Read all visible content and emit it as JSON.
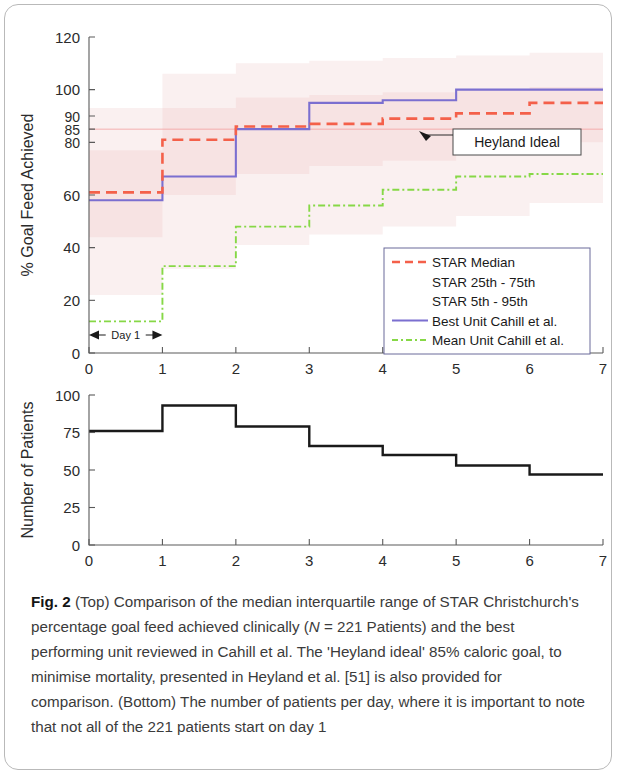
{
  "figure": {
    "label": "Fig. 2",
    "caption": "(Top) Comparison of the median interquartile range of STAR Christchurch's percentage goal feed achieved clinically (N = 221 Patients) and the best performing unit reviewed in Cahill et al. The 'Heyland ideal' 85% caloric goal, to minimise mortality, presented in Heyland et al. [51] is also provided for comparison. (Bottom) The number of patients per day, where it is important to note that not all of the 221 patients start on day 1"
  },
  "colors": {
    "star_median": "#f4604a",
    "star_iqr_band": "#f7e3e3",
    "star_5_95_band": "#faf0f0",
    "best_unit": "#7b6fd0",
    "mean_unit": "#86d846",
    "patients_line": "#1a1a1a",
    "axis": "#5a5a5a",
    "heyland_line": "#f4a0a0"
  },
  "annotations": {
    "heyland": {
      "text": "Heyland Ideal",
      "target_y": 85
    },
    "day1": {
      "text": "Day 1",
      "from_x": 0,
      "to_x": 1
    }
  },
  "legend": {
    "items": [
      {
        "label": "STAR Median",
        "style": "dashed",
        "color": "#f4604a",
        "show_sample": true
      },
      {
        "label": "STAR 25th - 75th",
        "style": "band",
        "color": "#f7e3e3",
        "show_sample": false
      },
      {
        "label": "STAR 5th - 95th",
        "style": "band",
        "color": "#faf0f0",
        "show_sample": false
      },
      {
        "label": "Best Unit Cahill et al.",
        "style": "solid",
        "color": "#7b6fd0",
        "show_sample": true
      },
      {
        "label": "Mean Unit Cahill et al.",
        "style": "dashdot",
        "color": "#86d846",
        "show_sample": true
      }
    ]
  },
  "chart_data": [
    {
      "type": "line",
      "id": "goal-feed-achieved",
      "title": "",
      "xlabel": "",
      "ylabel": "% Goal Feed Achieved",
      "xlim": [
        0,
        7
      ],
      "ylim": [
        0,
        120
      ],
      "xticks": [
        0,
        1,
        2,
        3,
        4,
        5,
        6,
        7
      ],
      "yticks": [
        0,
        20,
        40,
        60,
        80,
        85,
        90,
        100,
        120
      ],
      "grid": false,
      "legend_position": "lower-right",
      "step_style": "post",
      "x": [
        0,
        1,
        2,
        3,
        4,
        5,
        6,
        7
      ],
      "series": [
        {
          "name": "STAR Median",
          "values": [
            61,
            81,
            86,
            87,
            89,
            91,
            95,
            95
          ]
        },
        {
          "name": "STAR 25th",
          "values": [
            44,
            60,
            68,
            71,
            73,
            76,
            80,
            80
          ]
        },
        {
          "name": "STAR 75th",
          "values": [
            77,
            93,
            97,
            98,
            99,
            100,
            101,
            101
          ]
        },
        {
          "name": "STAR 5th",
          "values": [
            22,
            32,
            41,
            45,
            48,
            52,
            57,
            57
          ]
        },
        {
          "name": "STAR 95th",
          "values": [
            93,
            106,
            110,
            111,
            112,
            113,
            114,
            114
          ]
        },
        {
          "name": "Best Unit Cahill et al.",
          "values": [
            58,
            67,
            85,
            95,
            96,
            100,
            100,
            100
          ]
        },
        {
          "name": "Mean Unit Cahill et al.",
          "values": [
            12,
            33,
            48,
            56,
            62,
            67,
            68,
            68
          ]
        }
      ],
      "reference_lines": [
        {
          "name": "Heyland Ideal",
          "y": 85
        }
      ]
    },
    {
      "type": "line",
      "id": "number-of-patients",
      "title": "",
      "xlabel": "Days in ICU",
      "ylabel": "Number of Patients",
      "xlim": [
        0,
        7
      ],
      "ylim": [
        0,
        100
      ],
      "xticks": [
        0,
        1,
        2,
        3,
        4,
        5,
        6,
        7
      ],
      "yticks": [
        0,
        25,
        50,
        75,
        100
      ],
      "grid": false,
      "step_style": "post",
      "x": [
        0,
        1,
        2,
        3,
        4,
        5,
        6,
        7
      ],
      "series": [
        {
          "name": "Number of Patients",
          "values": [
            76,
            93,
            79,
            66,
            60,
            53,
            47,
            47
          ]
        }
      ]
    }
  ]
}
